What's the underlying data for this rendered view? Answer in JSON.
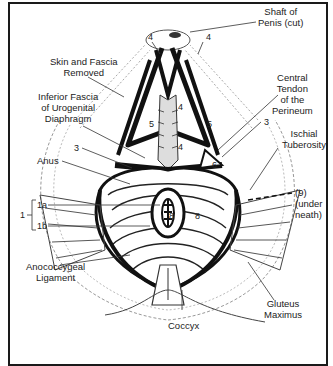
{
  "figure": {
    "labels": {
      "shaft_of_penis": [
        "Shaft of",
        "Penis (cut)"
      ],
      "skin_fascia_removed": [
        "Skin and Fascia",
        "Removed"
      ],
      "inferior_fascia": [
        "Inferior Fascia",
        "of Urogenital",
        "Diaphragm"
      ],
      "central_tendon": [
        "Central",
        "Tendon",
        "of the",
        "Perineum"
      ],
      "ischial_tuberosity": [
        "Ischial",
        "Tuberosity"
      ],
      "anus": "Anus",
      "anococcygeal_ligament": [
        "Anococcygeal",
        "Ligament"
      ],
      "gluteus_maximus": [
        "Gluteus",
        "Maximus"
      ],
      "coccyx": "Coccyx",
      "under_neath": [
        "(9)",
        "(under",
        "neath)"
      ]
    },
    "numbers": {
      "n1": "1",
      "n1a": "1a",
      "n1b": "1b",
      "n3_left": "3",
      "n3_right": "3",
      "n4_top_left": "4",
      "n4_top_right": "4",
      "n4_center_upper": "4",
      "n4_center_lower": "4",
      "n5_left": "5",
      "n5_right": "5",
      "n6": "6",
      "n8_left": "8",
      "n8_right": "8"
    },
    "colors": {
      "ink": "#1a1a1a",
      "paper": "#ffffff",
      "text": "#222222"
    }
  }
}
